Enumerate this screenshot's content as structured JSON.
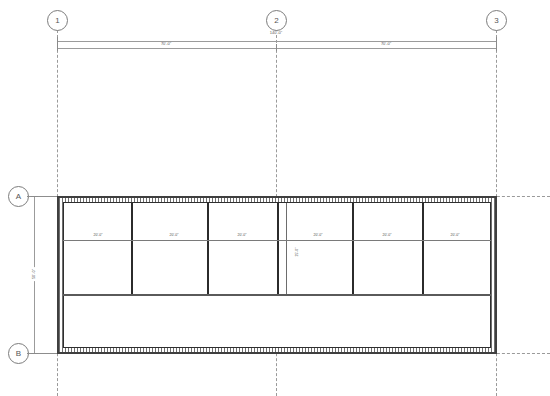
{
  "drawing": {
    "type": "architectural-floor-plan",
    "title": "Floor Plan"
  },
  "grid_bubbles": {
    "top": [
      {
        "label": "1",
        "x": 57
      },
      {
        "label": "2",
        "x": 276
      },
      {
        "label": "3",
        "x": 496
      }
    ],
    "left": [
      {
        "label": "A",
        "y": 195
      },
      {
        "label": "B",
        "y": 353
      }
    ]
  },
  "dimensions": {
    "overall_top": {
      "text": "140'-0\"",
      "x": 276,
      "y": 33
    },
    "segments_top": [
      {
        "text": "70'-0\"",
        "x": 166
      },
      {
        "text": "70'-0\"",
        "x": 386
      }
    ],
    "vertical_left": {
      "text": "50'-0\"",
      "x": 34,
      "y": 274
    },
    "interior_vertical": {
      "text": "25'-0\"",
      "x": 298,
      "y": 252
    }
  },
  "building": {
    "outline": {
      "x": 57,
      "y": 196,
      "width": 440,
      "height": 158
    },
    "bay_labels": [
      {
        "text": "20'-0\"",
        "x": 98
      },
      {
        "text": "20'-0\"",
        "x": 174
      },
      {
        "text": "20'-0\"",
        "x": 242
      },
      {
        "text": "20'-0\"",
        "x": 318
      },
      {
        "text": "20'-0\"",
        "x": 387
      },
      {
        "text": "20'-0\"",
        "x": 455
      }
    ],
    "bay_dividers_x": [
      131,
      207,
      277,
      286,
      352,
      422
    ],
    "midline_y": 240,
    "corridor_top_y": 294
  },
  "colors": {
    "line": "#3f3f3f",
    "thin_line": "#8d8d8d",
    "grid": "#9a9a9a",
    "hatch": "#6e6e6e",
    "background": "#ffffff"
  }
}
